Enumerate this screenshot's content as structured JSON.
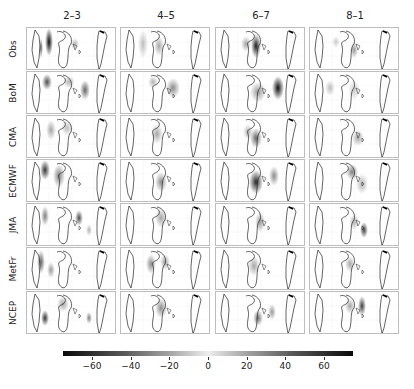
{
  "chart_data": {
    "type": "heatmap",
    "title": "",
    "columns": [
      "2–3",
      "4–5",
      "6–7",
      "8–1"
    ],
    "rows": [
      "Obs",
      "BoM",
      "CMA",
      "ECMWF",
      "JMA",
      "MetFr",
      "NCEP"
    ],
    "colorbar": {
      "ticks": [
        -60,
        -40,
        -20,
        0,
        20,
        40,
        60
      ],
      "range": [
        -75,
        75
      ],
      "colormap": "grayscale diverging (black at extremes, white at 0)",
      "orientation": "horizontal",
      "position": "bottom"
    },
    "grid": true,
    "legend": "none"
  },
  "col_titles": [
    "2–3",
    "4–5",
    "6–7",
    "8–1"
  ],
  "row_labels": [
    "Obs",
    "BoM",
    "CMA",
    "ECMWF",
    "JMA",
    "MetFr",
    "NCEP"
  ],
  "ticks": [
    "−60",
    "−40",
    "−20",
    "0",
    "20",
    "40",
    "60"
  ]
}
